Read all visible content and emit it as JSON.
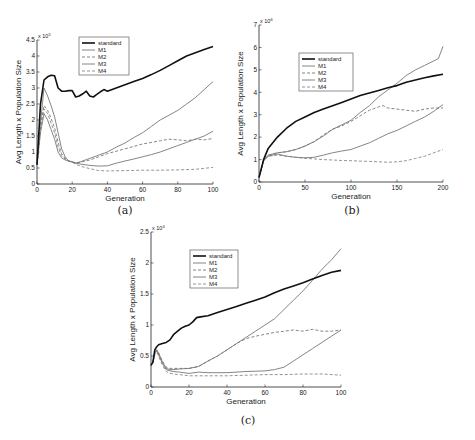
{
  "chart_data": [
    {
      "id": "a",
      "type": "line",
      "caption": "(a)",
      "title": "",
      "xlabel": "Generation",
      "ylabel": "Avg Length x Population Size",
      "y_multiplier": "x 10^5",
      "y_multiplier_base": "x 10",
      "y_multiplier_exp": "5",
      "xlim": [
        0,
        100
      ],
      "ylim": [
        0,
        4.5
      ],
      "xticks": [
        0,
        20,
        40,
        60,
        80,
        100
      ],
      "yticks": [
        0,
        0.5,
        1,
        1.5,
        2,
        2.5,
        3,
        3.5,
        4,
        4.5
      ],
      "ytick_labels": [
        "0",
        "0.5",
        "1",
        "1.5",
        "2",
        "2.5",
        "3",
        "3.5",
        "4",
        "4.5"
      ],
      "grid": false,
      "legend_position": "upper-left-inside",
      "pixel_box": {
        "x0": 37,
        "x1": 213,
        "y0": 184,
        "y1": 40
      },
      "series": [
        {
          "name": "standard",
          "style": "solid-thick",
          "color": "#111111",
          "x": [
            0,
            2,
            4,
            6,
            8,
            10,
            12,
            14,
            16,
            18,
            20,
            22,
            24,
            26,
            28,
            30,
            32,
            34,
            36,
            38,
            40,
            45,
            50,
            55,
            60,
            65,
            70,
            75,
            80,
            85,
            90,
            95,
            100
          ],
          "values": [
            0.6,
            2.5,
            3.25,
            3.35,
            3.4,
            3.38,
            3.0,
            2.9,
            2.9,
            2.92,
            2.92,
            2.72,
            2.75,
            2.82,
            2.9,
            2.75,
            2.72,
            2.8,
            2.88,
            2.95,
            2.9,
            3.0,
            3.1,
            3.2,
            3.3,
            3.42,
            3.55,
            3.7,
            3.85,
            4.0,
            4.1,
            4.2,
            4.3
          ]
        },
        {
          "name": "M1",
          "style": "solid-thin",
          "color": "#777777",
          "x": [
            0,
            2,
            4,
            6,
            8,
            10,
            12,
            14,
            16,
            18,
            20,
            22,
            25,
            30,
            35,
            40,
            45,
            50,
            55,
            60,
            65,
            70,
            75,
            80,
            85,
            90,
            95,
            100
          ],
          "values": [
            0.6,
            1.9,
            3.0,
            2.75,
            2.45,
            2.1,
            1.6,
            1.1,
            0.85,
            0.72,
            0.68,
            0.65,
            0.7,
            0.8,
            0.9,
            1.0,
            1.15,
            1.28,
            1.45,
            1.6,
            1.8,
            2.0,
            2.15,
            2.3,
            2.5,
            2.7,
            2.95,
            3.2
          ]
        },
        {
          "name": "M2",
          "style": "dashed",
          "color": "#777777",
          "x": [
            0,
            2,
            4,
            6,
            8,
            10,
            12,
            14,
            16,
            18,
            20,
            22,
            25,
            30,
            35,
            40,
            50,
            60,
            70,
            75,
            80,
            85,
            90,
            95,
            100
          ],
          "values": [
            0.6,
            1.8,
            2.45,
            2.3,
            2.05,
            1.75,
            1.3,
            0.95,
            0.8,
            0.72,
            0.68,
            0.66,
            0.68,
            0.75,
            0.85,
            0.95,
            1.1,
            1.25,
            1.35,
            1.4,
            1.38,
            1.35,
            1.4,
            1.38,
            1.42
          ]
        },
        {
          "name": "M3",
          "style": "solid-thin",
          "color": "#777777",
          "x": [
            0,
            2,
            4,
            6,
            8,
            10,
            12,
            14,
            16,
            18,
            20,
            22,
            25,
            30,
            35,
            40,
            45,
            50,
            55,
            60,
            65,
            70,
            75,
            80,
            85,
            90,
            95,
            100
          ],
          "values": [
            0.6,
            1.6,
            2.2,
            2.0,
            1.7,
            1.4,
            1.0,
            0.82,
            0.75,
            0.72,
            0.7,
            0.66,
            0.62,
            0.58,
            0.56,
            0.57,
            0.65,
            0.72,
            0.78,
            0.85,
            0.92,
            1.0,
            1.1,
            1.2,
            1.3,
            1.4,
            1.5,
            1.65
          ]
        },
        {
          "name": "M4",
          "style": "dashed",
          "color": "#888888",
          "x": [
            0,
            2,
            4,
            6,
            8,
            10,
            12,
            14,
            16,
            18,
            20,
            22,
            25,
            30,
            35,
            40,
            50,
            60,
            70,
            80,
            90,
            100
          ],
          "values": [
            0.6,
            1.75,
            2.35,
            2.2,
            1.9,
            1.6,
            1.15,
            0.88,
            0.78,
            0.72,
            0.68,
            0.62,
            0.55,
            0.48,
            0.42,
            0.41,
            0.42,
            0.43,
            0.43,
            0.44,
            0.46,
            0.52
          ]
        }
      ]
    },
    {
      "id": "b",
      "type": "line",
      "caption": "(b)",
      "title": "",
      "xlabel": "Generation",
      "ylabel": "Avg Length x Population Size",
      "y_multiplier": "x 10^6",
      "y_multiplier_base": "x 10",
      "y_multiplier_exp": "6",
      "xlim": [
        0,
        200
      ],
      "ylim": [
        0,
        7
      ],
      "xticks": [
        0,
        50,
        100,
        150,
        200
      ],
      "yticks": [
        0,
        1,
        2,
        3,
        4,
        5,
        6,
        7
      ],
      "ytick_labels": [
        "0",
        "1",
        "2",
        "3",
        "4",
        "5",
        "6",
        "7"
      ],
      "grid": false,
      "legend_position": "upper-left-inside",
      "pixel_box": {
        "x0": 259,
        "x1": 443,
        "y0": 182,
        "y1": 25
      },
      "series": [
        {
          "name": "standard",
          "style": "solid-thick",
          "color": "#111111",
          "x": [
            0,
            5,
            10,
            20,
            30,
            40,
            50,
            60,
            70,
            80,
            90,
            100,
            110,
            120,
            130,
            140,
            150,
            160,
            170,
            180,
            190,
            200
          ],
          "values": [
            0.2,
            1.0,
            1.5,
            2.0,
            2.4,
            2.7,
            2.9,
            3.1,
            3.25,
            3.4,
            3.55,
            3.7,
            3.85,
            3.97,
            4.08,
            4.2,
            4.3,
            4.45,
            4.55,
            4.65,
            4.73,
            4.8
          ]
        },
        {
          "name": "M1",
          "style": "solid-thin",
          "color": "#777777",
          "x": [
            0,
            5,
            10,
            20,
            30,
            40,
            50,
            60,
            70,
            80,
            90,
            100,
            110,
            120,
            130,
            140,
            150,
            160,
            170,
            180,
            190,
            200
          ],
          "values": [
            0.2,
            0.95,
            1.15,
            1.25,
            1.15,
            1.1,
            1.08,
            1.1,
            1.2,
            1.3,
            1.38,
            1.45,
            1.6,
            1.75,
            1.95,
            2.15,
            2.3,
            2.5,
            2.7,
            2.9,
            3.15,
            3.45
          ]
        },
        {
          "name": "M2",
          "style": "dashed",
          "color": "#777777",
          "x": [
            0,
            5,
            10,
            20,
            30,
            40,
            50,
            60,
            70,
            80,
            90,
            100,
            110,
            120,
            130,
            135,
            140,
            150,
            160,
            170,
            180,
            190,
            200
          ],
          "values": [
            0.2,
            0.95,
            1.2,
            1.3,
            1.35,
            1.45,
            1.6,
            1.8,
            2.1,
            2.35,
            2.5,
            2.7,
            2.95,
            3.2,
            3.35,
            3.4,
            3.3,
            3.25,
            3.2,
            3.15,
            3.25,
            3.3,
            3.3
          ]
        },
        {
          "name": "M3",
          "style": "solid-thin",
          "color": "#777777",
          "x": [
            0,
            5,
            10,
            20,
            30,
            40,
            50,
            60,
            70,
            80,
            90,
            100,
            110,
            120,
            130,
            140,
            150,
            160,
            170,
            180,
            190,
            195,
            200
          ],
          "values": [
            0.2,
            0.95,
            1.2,
            1.3,
            1.35,
            1.45,
            1.6,
            1.8,
            2.05,
            2.35,
            2.55,
            2.75,
            3.1,
            3.4,
            3.8,
            4.1,
            4.4,
            4.75,
            5.0,
            5.2,
            5.4,
            5.5,
            6.05
          ]
        },
        {
          "name": "M4",
          "style": "dashed",
          "color": "#888888",
          "x": [
            0,
            5,
            10,
            20,
            30,
            40,
            50,
            60,
            70,
            80,
            90,
            100,
            110,
            120,
            130,
            140,
            150,
            160,
            170,
            180,
            190,
            200
          ],
          "values": [
            0.2,
            0.95,
            1.15,
            1.2,
            1.15,
            1.1,
            1.05,
            1.03,
            1.0,
            0.98,
            0.96,
            0.95,
            0.93,
            0.92,
            0.9,
            0.88,
            0.9,
            0.95,
            1.05,
            1.15,
            1.3,
            1.45
          ]
        }
      ]
    },
    {
      "id": "c",
      "type": "line",
      "caption": "(c)",
      "title": "",
      "xlabel": "Generation",
      "ylabel": "Avg Length x Population Size",
      "y_multiplier": "x 10^4",
      "y_multiplier_base": "x 10",
      "y_multiplier_exp": "4",
      "xlim": [
        0,
        100
      ],
      "ylim": [
        0,
        2.5
      ],
      "xticks": [
        0,
        20,
        40,
        60,
        80,
        100
      ],
      "yticks": [
        0,
        0.5,
        1,
        1.5,
        2,
        2.5
      ],
      "ytick_labels": [
        "0",
        "0.5",
        "1",
        "1.5",
        "2",
        "2.5"
      ],
      "grid": false,
      "legend_position": "upper-left-inside",
      "pixel_box": {
        "x0": 151,
        "x1": 341,
        "y0": 387,
        "y1": 232
      },
      "series": [
        {
          "name": "standard",
          "style": "solid-thick",
          "color": "#111111",
          "x": [
            0,
            1,
            2,
            3,
            4,
            6,
            8,
            10,
            12,
            14,
            16,
            18,
            20,
            22,
            24,
            26,
            30,
            35,
            40,
            45,
            50,
            55,
            60,
            65,
            70,
            75,
            80,
            85,
            90,
            95,
            100
          ],
          "values": [
            0.35,
            0.4,
            0.6,
            0.65,
            0.68,
            0.7,
            0.72,
            0.76,
            0.85,
            0.9,
            0.95,
            0.98,
            1.0,
            1.05,
            1.12,
            1.13,
            1.15,
            1.2,
            1.25,
            1.3,
            1.35,
            1.4,
            1.45,
            1.52,
            1.58,
            1.63,
            1.68,
            1.74,
            1.8,
            1.85,
            1.88
          ]
        },
        {
          "name": "M1",
          "style": "solid-thin",
          "color": "#777777",
          "x": [
            0,
            1,
            2,
            3,
            4,
            6,
            8,
            10,
            12,
            15,
            20,
            25,
            30,
            35,
            40,
            45,
            50,
            55,
            60,
            65,
            70,
            75,
            80,
            85,
            90,
            95,
            100
          ],
          "values": [
            0.35,
            0.4,
            0.55,
            0.6,
            0.55,
            0.4,
            0.3,
            0.28,
            0.28,
            0.29,
            0.3,
            0.33,
            0.42,
            0.5,
            0.6,
            0.7,
            0.8,
            0.9,
            1.0,
            1.1,
            1.25,
            1.4,
            1.55,
            1.72,
            1.9,
            2.05,
            2.23
          ]
        },
        {
          "name": "M2",
          "style": "dashed",
          "color": "#777777",
          "x": [
            0,
            1,
            2,
            3,
            4,
            6,
            8,
            10,
            12,
            15,
            20,
            25,
            30,
            35,
            40,
            45,
            50,
            55,
            60,
            65,
            70,
            75,
            80,
            85,
            90,
            95,
            100
          ],
          "values": [
            0.35,
            0.4,
            0.55,
            0.6,
            0.55,
            0.42,
            0.32,
            0.3,
            0.3,
            0.3,
            0.3,
            0.33,
            0.42,
            0.5,
            0.6,
            0.7,
            0.78,
            0.82,
            0.85,
            0.88,
            0.9,
            0.92,
            0.9,
            0.93,
            0.9,
            0.9,
            0.92
          ]
        },
        {
          "name": "M3",
          "style": "solid-thin",
          "color": "#777777",
          "x": [
            0,
            1,
            2,
            3,
            4,
            6,
            8,
            10,
            12,
            15,
            20,
            25,
            30,
            40,
            50,
            60,
            65,
            70,
            75,
            80,
            85,
            90,
            95,
            100
          ],
          "values": [
            0.35,
            0.4,
            0.55,
            0.58,
            0.52,
            0.38,
            0.28,
            0.26,
            0.25,
            0.24,
            0.22,
            0.24,
            0.23,
            0.23,
            0.25,
            0.26,
            0.28,
            0.32,
            0.42,
            0.52,
            0.62,
            0.72,
            0.82,
            0.92
          ]
        },
        {
          "name": "M4",
          "style": "dashed",
          "color": "#888888",
          "x": [
            0,
            1,
            2,
            3,
            4,
            6,
            8,
            10,
            12,
            15,
            20,
            25,
            30,
            40,
            50,
            60,
            70,
            80,
            90,
            100
          ],
          "values": [
            0.35,
            0.4,
            0.52,
            0.56,
            0.5,
            0.35,
            0.25,
            0.22,
            0.21,
            0.2,
            0.18,
            0.18,
            0.18,
            0.18,
            0.19,
            0.2,
            0.2,
            0.21,
            0.21,
            0.19
          ]
        }
      ]
    }
  ],
  "legend": {
    "entries": [
      "standard",
      "M1",
      "M2",
      "M3",
      "M4"
    ]
  }
}
